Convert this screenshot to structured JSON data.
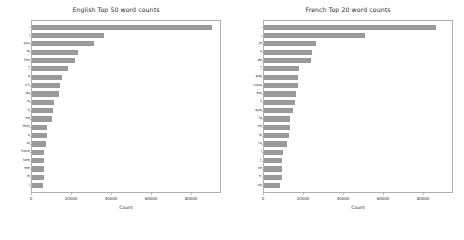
{
  "figure": {
    "background": "#ffffff",
    "bar_color": "#9a9a9a",
    "axis_color": "#b0b0b0"
  },
  "chart_data": [
    {
      "type": "bar",
      "orientation": "horizontal",
      "title": "English Top 50 word counts",
      "xlabel": "Count",
      "ylabel": "",
      "xlim": [
        0,
        95000
      ],
      "xticks": [
        0,
        20000,
        40000,
        60000,
        80000
      ],
      "xticklabels": [
        "0",
        "20000",
        "40000",
        "60000",
        "80000"
      ],
      "grid": false,
      "legend": null,
      "categories": [
        ",",
        "i",
        "you",
        "to",
        "the",
        "?",
        "a",
        "n't",
        "do",
        "is",
        "it",
        "he",
        "that",
        "'s",
        "of",
        "have",
        "tom",
        "me",
        "in",
        "!"
      ],
      "values": [
        91000,
        36500,
        31500,
        23000,
        21500,
        18000,
        15000,
        14000,
        13500,
        11000,
        10500,
        10000,
        7800,
        7500,
        7300,
        6300,
        6200,
        6100,
        6000,
        5800
      ]
    },
    {
      "type": "bar",
      "orientation": "horizontal",
      "title": "French Top 20 word counts",
      "xlabel": "Count",
      "ylabel": "",
      "xlim": [
        0,
        95000
      ],
      "xticks": [
        0,
        20000,
        40000,
        60000,
        80000
      ],
      "xticklabels": [
        "0",
        "20000",
        "40000",
        "60000",
        "80000"
      ],
      "grid": false,
      "legend": null,
      "categories": [
        ".",
        ",",
        "je",
        "a",
        "de",
        "?",
        "pas",
        "vous",
        "est",
        "il",
        "que",
        "la",
        "ne",
        "le",
        "tu",
        "!",
        "j'",
        "ce",
        "n'",
        "un"
      ],
      "values": [
        87000,
        51000,
        26500,
        24500,
        23500,
        17500,
        17300,
        17000,
        16300,
        15500,
        14800,
        13200,
        13000,
        12800,
        11500,
        9500,
        9300,
        9200,
        9100,
        8200
      ]
    }
  ]
}
